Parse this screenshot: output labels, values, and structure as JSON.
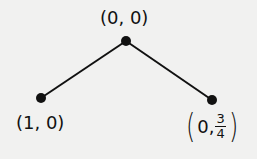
{
  "diagram": {
    "type": "game-tree",
    "nodes": [
      {
        "id": "root",
        "label": "(0, 0)",
        "x": 126,
        "y": 41
      },
      {
        "id": "left",
        "label": "(1, 0)",
        "x": 41,
        "y": 98
      },
      {
        "id": "right",
        "label_prefix": "0,",
        "frac_num": "3",
        "frac_den": "4",
        "x": 212,
        "y": 100
      }
    ],
    "edges": [
      {
        "from": "root",
        "to": "left"
      },
      {
        "from": "root",
        "to": "right"
      }
    ],
    "colors": {
      "background": "#f1f1f0",
      "line": "#111111"
    }
  }
}
